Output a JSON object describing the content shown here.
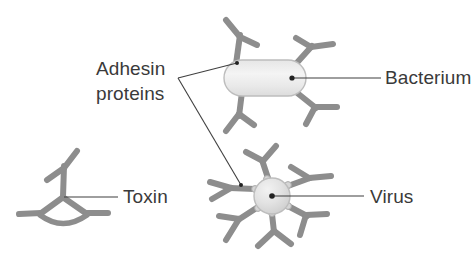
{
  "figure": {
    "background_color": "#ffffff",
    "width": 472,
    "height": 266
  },
  "palette": {
    "protein_gray": "#8d8d8d",
    "protein_gray_dark": "#7b7b7b",
    "protein_gray_light": "#a6a6a6",
    "body_fill_light": "#f2f2f2",
    "body_fill_mid": "#e2e2e2",
    "body_outline": "#b9b9b9",
    "leader_line": "#3f3f3f",
    "text_color": "#3a3a3a"
  },
  "labels": [
    {
      "id": "adhesin-proteins",
      "line1": "Adhesin",
      "line2": "proteins",
      "x": 96,
      "y": 75,
      "anchor": "start",
      "leader": "branching"
    },
    {
      "id": "bacterium",
      "text": "Bacterium",
      "x": 385,
      "y": 81,
      "anchor": "start",
      "leader": "horizontal"
    },
    {
      "id": "virus",
      "text": "Virus",
      "x": 370,
      "y": 200,
      "anchor": "start",
      "leader": "horizontal"
    },
    {
      "id": "toxin",
      "text": "Toxin",
      "x": 123,
      "y": 200,
      "anchor": "start",
      "leader": "horizontal"
    }
  ],
  "structures": [
    {
      "id": "bacterium",
      "shape": "capsule",
      "center_x": 265,
      "center_y": 78,
      "width": 82,
      "height": 36,
      "adhesin_count": 4
    },
    {
      "id": "virus",
      "shape": "sphere",
      "center_x": 272,
      "center_y": 196,
      "radius": 18,
      "adhesin_count": 6
    },
    {
      "id": "toxin",
      "shape": "trimer",
      "center_x": 63,
      "center_y": 196,
      "arm_count": 3
    }
  ]
}
